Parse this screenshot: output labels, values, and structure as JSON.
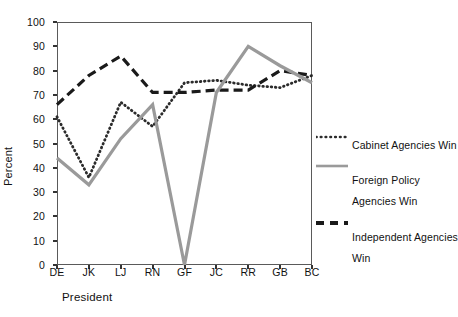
{
  "chart_data": {
    "type": "line",
    "title": "",
    "xlabel": "President",
    "ylabel": "Percent",
    "categories": [
      "DE",
      "JK",
      "LJ",
      "RN",
      "GF",
      "JC",
      "RR",
      "GB",
      "BC"
    ],
    "ylim": [
      0,
      100
    ],
    "yticks": [
      0,
      10,
      20,
      30,
      40,
      50,
      60,
      70,
      80,
      90,
      100
    ],
    "grid": false,
    "legend_position": "right",
    "series": [
      {
        "name": "Cabinet Agencies Win",
        "style": "dotted",
        "color": "#2b2b2b",
        "values": [
          61,
          36,
          67,
          57,
          75,
          76,
          74,
          73,
          78
        ]
      },
      {
        "name": "Foreign Policy Agencies Win",
        "style": "solid",
        "color": "#9a9a9a",
        "values": [
          44,
          33,
          52,
          66,
          0,
          71,
          90,
          82,
          75
        ]
      },
      {
        "name": "Independent Agencies Win",
        "style": "dashed",
        "color": "#1a1a1a",
        "values": [
          66,
          78,
          86,
          71,
          71,
          72,
          72,
          80,
          78
        ]
      }
    ]
  },
  "axes": {
    "y_title": "Percent",
    "x_title": "President",
    "y_tick_labels": [
      "0",
      "10",
      "20",
      "30",
      "40",
      "50",
      "60",
      "70",
      "80",
      "90",
      "100"
    ],
    "x_tick_labels": [
      "DE",
      "JK",
      "LJ",
      "RN",
      "GF",
      "JC",
      "RR",
      "GB",
      "BC"
    ]
  },
  "legend": {
    "entries": [
      {
        "label": "Cabinet Agencies Win",
        "style": "dotted"
      },
      {
        "label_line1": "Foreign Policy",
        "label_line2": "Agencies Win",
        "style": "solid"
      },
      {
        "label_line1": "Independent Agencies",
        "label_line2": "Win",
        "style": "dashed"
      }
    ]
  }
}
